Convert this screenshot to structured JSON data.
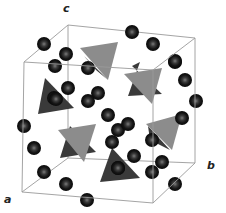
{
  "diagram": {
    "type": "crystal-structure-unit-cell",
    "axes": {
      "a": "a",
      "b": "b",
      "c": "c"
    },
    "colors": {
      "cell_edge": "#9a9a9a",
      "sphere_dark": "#1a1a1a",
      "sphere_highlight": "#6a6a6a",
      "tetra_light": "#8c8c8c",
      "tetra_dark": "#3a3a3a",
      "tetra_shadow": "#262626"
    },
    "atom_count_visible": 34,
    "tetrahedra_count_visible": 8
  }
}
